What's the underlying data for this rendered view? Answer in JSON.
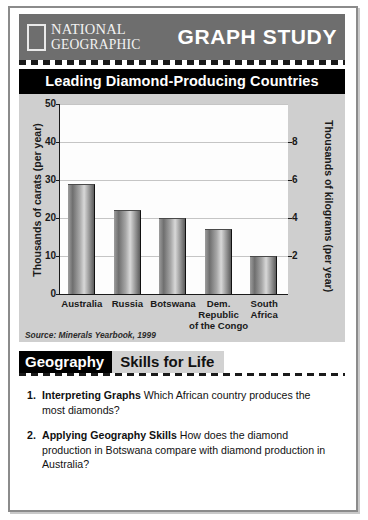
{
  "header": {
    "logo_line1": "NATIONAL",
    "logo_line2": "GEOGRAPHIC",
    "section_title": "GRAPH STUDY"
  },
  "chart_data": {
    "type": "bar",
    "title": "Leading Diamond-Producing Countries",
    "categories": [
      "Australia",
      "Russia",
      "Botswana",
      "Dem. Republic of the Congo",
      "South Africa"
    ],
    "category_lines": [
      [
        "Australia"
      ],
      [
        "Russia"
      ],
      [
        "Botswana"
      ],
      [
        "Dem. Republic",
        "of the Congo"
      ],
      [
        "South",
        "Africa"
      ]
    ],
    "values": [
      29,
      22,
      20,
      17,
      10
    ],
    "xlabel": "",
    "ylabel": "Thousands of carats (per year)",
    "ylabel_right": "Thousands of kilograms (per year)",
    "ylim": [
      0,
      50
    ],
    "yticks": [
      0,
      10,
      20,
      30,
      40,
      50
    ],
    "ylim_right": [
      0,
      10
    ],
    "yticks_right": [
      2,
      4,
      6,
      8
    ],
    "grid": true,
    "legend": "none",
    "source": "Source: Minerals Yearbook, 1999",
    "bar_color": "#8d8d8d"
  },
  "skills": {
    "badge": "Geography",
    "heading": "Skills for Life"
  },
  "questions": [
    {
      "number": "1.",
      "lead": "Interpreting Graphs",
      "text": "Which African country produces the most diamonds?"
    },
    {
      "number": "2.",
      "lead": "Applying Geography Skills",
      "text": "How does the diamond production in Botswana compare with diamond production in Australia?"
    }
  ]
}
